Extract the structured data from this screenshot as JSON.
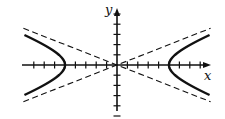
{
  "diagram": {
    "equation": "x^2/25 - y^2/4 = 1",
    "x_axis_label": "x",
    "y_axis_label": "y",
    "a": 5,
    "b": 2,
    "x_ticks": [
      -8,
      -7,
      -6,
      -5,
      -4,
      -3,
      -2,
      -1,
      1,
      2,
      3,
      4,
      5,
      6,
      7,
      8
    ],
    "y_ticks": [
      -5,
      -4,
      -3,
      -2,
      -1,
      1,
      2,
      3,
      4,
      5
    ],
    "x_range": [
      -9,
      9
    ],
    "y_range": [
      -5.3,
      5.3
    ],
    "asymptote_style": "dashed",
    "curve_color": "#111111",
    "axis_color": "#111111"
  }
}
